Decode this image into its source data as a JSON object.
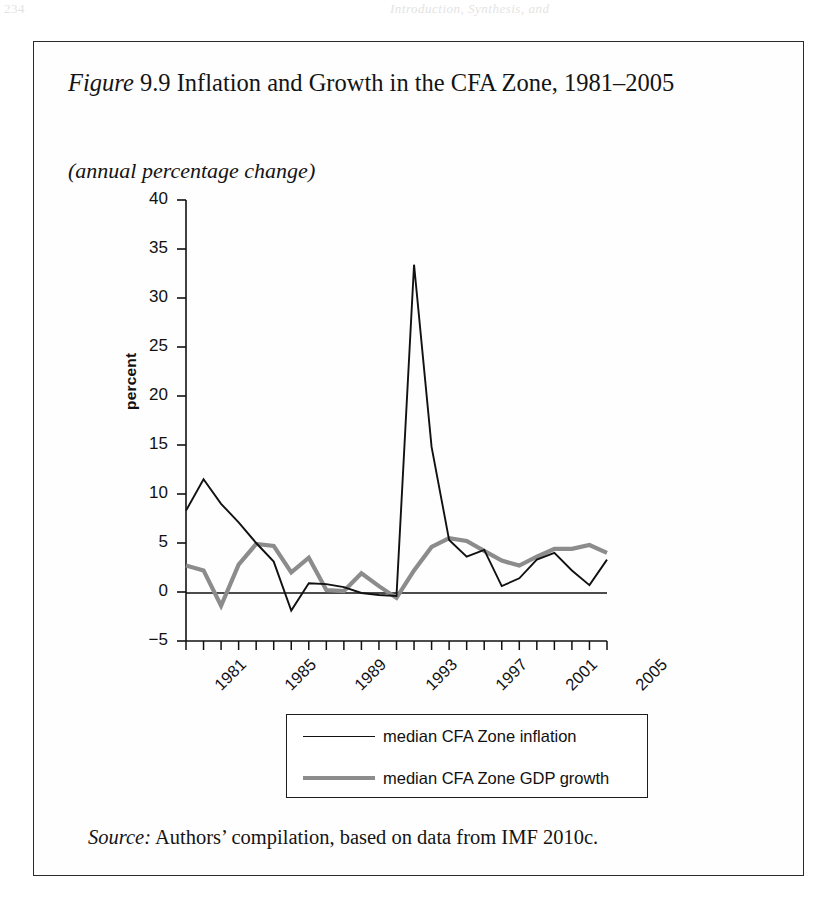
{
  "page": {
    "bleed_left": "234",
    "bleed_right": "Introduction, Synthesis, and"
  },
  "figure": {
    "label": "Figure",
    "number": "9.9",
    "title_rest": " Inflation and Growth in the CFA Zone, 1981–2005",
    "subtitle": "(annual percentage change)",
    "source_label": "Source:",
    "source_text": " Authors’ compilation, based on data from IMF 2010c."
  },
  "legend": {
    "items": [
      {
        "label": "median CFA Zone inflation",
        "color": "#111111",
        "style": "thin-black"
      },
      {
        "label": "median CFA Zone GDP growth",
        "color": "#8c8c8c",
        "style": "thick-gray"
      }
    ]
  },
  "chart_data": {
    "type": "line",
    "title": "Figure 9.9 Inflation and Growth in the CFA Zone, 1981–2005",
    "subtitle": "(annual percentage change)",
    "xlabel": "",
    "ylabel": "percent",
    "ylim": [
      -5,
      40
    ],
    "yticks": [
      -5,
      0,
      5,
      10,
      15,
      20,
      25,
      30,
      35,
      40
    ],
    "ytick_labels": [
      "−5",
      "0",
      "5",
      "10",
      "15",
      "20",
      "25",
      "30",
      "35",
      "40"
    ],
    "xlim": [
      1981,
      2005
    ],
    "xticks": [
      1981,
      1982,
      1983,
      1984,
      1985,
      1986,
      1987,
      1988,
      1989,
      1990,
      1991,
      1992,
      1993,
      1994,
      1995,
      1996,
      1997,
      1998,
      1999,
      2000,
      2001,
      2002,
      2003,
      2004,
      2005
    ],
    "xtick_labels_shown": [
      "1981",
      "1985",
      "1989",
      "1993",
      "1997",
      "2001",
      "2005"
    ],
    "xtick_label_rotation": -45,
    "grid": false,
    "legend_position": "below-axes",
    "x": [
      1981,
      1982,
      1983,
      1984,
      1985,
      1986,
      1987,
      1988,
      1989,
      1990,
      1991,
      1992,
      1993,
      1994,
      1995,
      1996,
      1997,
      1998,
      1999,
      2000,
      2001,
      2002,
      2003,
      2004,
      2005
    ],
    "series": [
      {
        "name": "median CFA Zone inflation",
        "color": "#111111",
        "width": 1.9,
        "values": [
          8.3,
          11.5,
          9.0,
          7.1,
          5.0,
          3.1,
          -1.9,
          0.9,
          0.8,
          0.5,
          -0.1,
          -0.3,
          -0.4,
          33.4,
          14.8,
          5.3,
          3.6,
          4.3,
          0.6,
          1.4,
          3.3,
          4.0,
          2.2,
          0.7,
          3.3
        ]
      },
      {
        "name": "median CFA Zone GDP growth",
        "color": "#8c8c8c",
        "width": 4.2,
        "values": [
          2.7,
          2.2,
          -1.4,
          2.8,
          4.9,
          4.7,
          2.0,
          3.5,
          0.2,
          0.1,
          1.9,
          0.6,
          -0.6,
          2.2,
          4.6,
          5.5,
          5.2,
          4.2,
          3.2,
          2.7,
          3.6,
          4.4,
          4.4,
          4.8,
          4.0
        ]
      }
    ]
  }
}
